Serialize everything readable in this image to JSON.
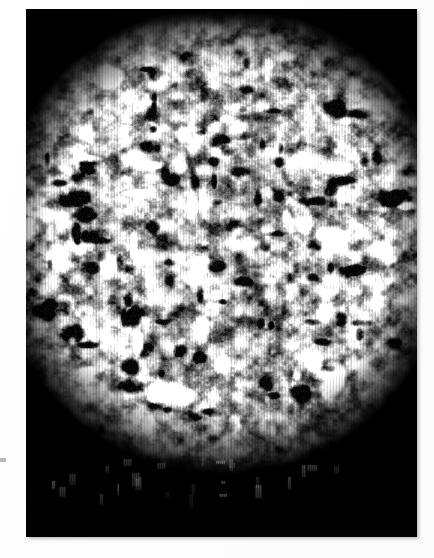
{
  "page": {
    "width": 434,
    "height": 558,
    "background_color": "#ffffff",
    "paper_note": "scanned print on white page"
  },
  "plate": {
    "name": "photographic-plate",
    "x": 26,
    "y": 9,
    "width": 391,
    "height": 528,
    "background_color": "#000000",
    "border_color": "#000000"
  },
  "margin_tick": {
    "x": 0,
    "y": 458,
    "width": 6,
    "height": 4,
    "color": "#b9b9b9"
  },
  "chart_data": {
    "type": "heatmap",
    "title": "",
    "subtitle": "",
    "xlabel": "",
    "ylabel": "",
    "legend": [],
    "grid": false,
    "colormap": "grayscale",
    "value_range": [
      0,
      255
    ],
    "background_value": 0,
    "canvas": {
      "width": 391,
      "height": 528
    },
    "disc": {
      "shape": "ellipse",
      "center_x": 196,
      "center_y": 230,
      "radius_x": 212,
      "radius_y": 218,
      "edge_softness": 26,
      "top_cut_y": 18,
      "bottom_cut_y": 448
    },
    "texture": {
      "stripe_period_px": 3,
      "stripe_contrast": 0.55,
      "blob_scale_x": 13,
      "blob_scale_y": 11,
      "noise_gain": 1.45,
      "gamma": 0.85,
      "mean_level": 150,
      "dark_blob_count": 120,
      "bright_patch_count": 90
    },
    "stray_streaks": {
      "count": 26,
      "region_y": [
        446,
        488
      ],
      "brightness": [
        18,
        70
      ],
      "note": "faint isolated vertical streaks below the main disc"
    },
    "axis_ranges": {
      "x": [
        0,
        391
      ],
      "y": [
        0,
        528
      ]
    },
    "tick_labels": {
      "x": [],
      "y": []
    }
  }
}
